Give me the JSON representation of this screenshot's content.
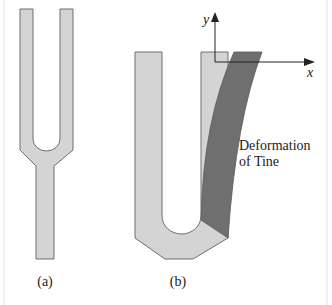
{
  "figure": {
    "panels": [
      {
        "id": "a",
        "label": "(a)",
        "description": "tuning fork"
      },
      {
        "id": "b",
        "label": "(b)",
        "description": "tine deformation"
      }
    ],
    "axes": {
      "x_label": "x",
      "y_label": "y"
    },
    "annotation": {
      "line1": "Deformation",
      "line2": "of Tine"
    },
    "colors": {
      "fork_fill": "#d4d4d4",
      "fork_stroke": "#6e6e6e",
      "deformed_fill": "#6f6f6f",
      "axis": "#222222",
      "border": "#d8d8d8"
    }
  }
}
